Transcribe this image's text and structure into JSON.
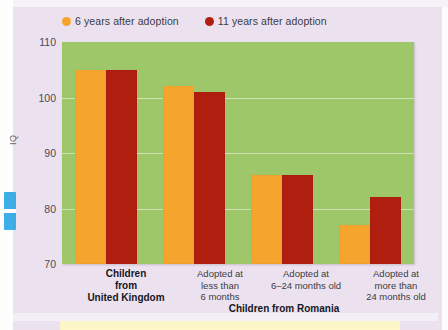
{
  "colors": {
    "series_6yr": "#f5a52e",
    "series_11yr": "#b01e10",
    "plot_background": "#9dc768",
    "page_background": "#ece2ef",
    "gridline": "#d9e8c2"
  },
  "legend": {
    "items": [
      {
        "label": "6 years after adoption",
        "marker": "orange-circle-marker",
        "color": "#f5a52e"
      },
      {
        "label": "11 years after adoption",
        "marker": "dark-red-circle-marker",
        "color": "#b01e10"
      }
    ]
  },
  "axis": {
    "y_label": "IQ",
    "y_ticks": [
      "110",
      "100",
      "90",
      "80",
      "70"
    ]
  },
  "group_labels": [
    {
      "text": "Children from United Kingdom",
      "lines": [
        "Children",
        "from",
        "United Kingdom"
      ]
    },
    {
      "text": "Children from Romania",
      "lines": [
        "Children from Romania"
      ]
    }
  ],
  "category_labels": [
    {
      "lines": [
        "Adopted at",
        "less than",
        "6 months"
      ]
    },
    {
      "lines": [
        "Adopted at",
        "6–24 months old"
      ]
    },
    {
      "lines": [
        "Adopted at",
        "more than",
        "24 months old"
      ]
    }
  ],
  "chart_data": {
    "type": "bar",
    "title": "",
    "xlabel": "",
    "ylabel": "IQ",
    "ylim": [
      70,
      110
    ],
    "yticks": [
      70,
      80,
      90,
      100,
      110
    ],
    "grid": true,
    "legend_position": "top-left",
    "categories": [
      "Children from United Kingdom",
      "Adopted at less than 6 months",
      "Adopted at 6–24 months old",
      "Adopted at more than 24 months old"
    ],
    "series": [
      {
        "name": "6 years after adoption",
        "color": "#f5a52e",
        "values": [
          105,
          102,
          86,
          77
        ]
      },
      {
        "name": "11 years after adoption",
        "color": "#b01e10",
        "values": [
          105,
          101,
          86,
          82
        ]
      }
    ]
  }
}
